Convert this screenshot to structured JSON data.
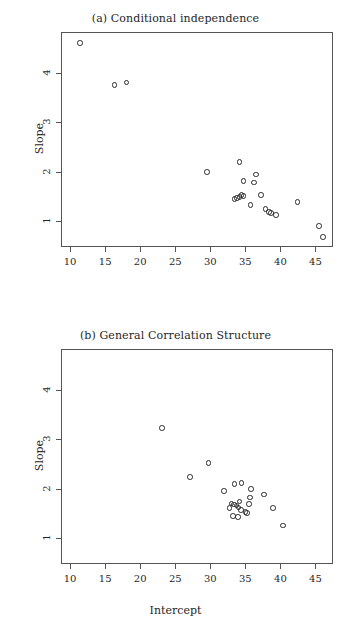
{
  "figure": {
    "width": 351,
    "height": 634,
    "background": "#ffffff",
    "marker_color": "#2a2a2a",
    "axis_color": "#555555"
  },
  "chart_data": [
    {
      "type": "scatter",
      "panel": "a",
      "title": "(a) Conditional independence",
      "xlabel": "",
      "ylabel": "Slope",
      "xlim": [
        8.7,
        47.5
      ],
      "ylim": [
        0.48,
        4.82
      ],
      "xticks": [
        10,
        15,
        20,
        25,
        30,
        35,
        40,
        45
      ],
      "xticklabels": [
        "10",
        "15",
        "20",
        "25",
        "30",
        "35",
        "40",
        "45"
      ],
      "yticks": [
        1,
        2,
        3,
        4
      ],
      "yticklabels": [
        "1",
        "2",
        "3",
        "4"
      ],
      "grid": false,
      "legend": false,
      "marker": "open-circle",
      "n_points": 22,
      "points": [
        {
          "x": 11.3,
          "y": 4.62
        },
        {
          "x": 16.2,
          "y": 3.77
        },
        {
          "x": 17.9,
          "y": 3.82
        },
        {
          "x": 29.4,
          "y": 2.01
        },
        {
          "x": 34.0,
          "y": 2.22
        },
        {
          "x": 36.4,
          "y": 1.96
        },
        {
          "x": 34.6,
          "y": 1.83
        },
        {
          "x": 36.1,
          "y": 1.8
        },
        {
          "x": 33.3,
          "y": 1.47
        },
        {
          "x": 34.0,
          "y": 1.51
        },
        {
          "x": 34.3,
          "y": 1.55
        },
        {
          "x": 34.6,
          "y": 1.53
        },
        {
          "x": 37.1,
          "y": 1.55
        },
        {
          "x": 35.6,
          "y": 1.35
        },
        {
          "x": 37.7,
          "y": 1.27
        },
        {
          "x": 38.2,
          "y": 1.21
        },
        {
          "x": 38.5,
          "y": 1.19
        },
        {
          "x": 39.2,
          "y": 1.15
        },
        {
          "x": 42.3,
          "y": 1.41
        },
        {
          "x": 45.4,
          "y": 0.93
        },
        {
          "x": 45.9,
          "y": 0.7
        },
        {
          "x": 33.7,
          "y": 1.49
        }
      ]
    },
    {
      "type": "scatter",
      "panel": "b",
      "title": "(b) General Correlation Structure",
      "xlabel": "Intercept",
      "ylabel": "Slope",
      "xlim": [
        8.7,
        47.5
      ],
      "ylim": [
        0.48,
        4.82
      ],
      "xticks": [
        10,
        15,
        20,
        25,
        30,
        35,
        40,
        45
      ],
      "xticklabels": [
        "10",
        "15",
        "20",
        "25",
        "30",
        "35",
        "40",
        "45"
      ],
      "yticks": [
        1,
        2,
        3,
        4
      ],
      "yticklabels": [
        "1",
        "2",
        "3",
        "4"
      ],
      "grid": false,
      "legend": false,
      "marker": "open-circle",
      "n_points": 23,
      "points": [
        {
          "x": 23.0,
          "y": 3.25
        },
        {
          "x": 29.6,
          "y": 2.54
        },
        {
          "x": 27.0,
          "y": 2.26
        },
        {
          "x": 33.3,
          "y": 2.11
        },
        {
          "x": 34.3,
          "y": 2.13
        },
        {
          "x": 31.8,
          "y": 1.97
        },
        {
          "x": 35.7,
          "y": 2.01
        },
        {
          "x": 35.5,
          "y": 1.84
        },
        {
          "x": 34.0,
          "y": 1.76
        },
        {
          "x": 35.4,
          "y": 1.71
        },
        {
          "x": 32.9,
          "y": 1.72
        },
        {
          "x": 33.2,
          "y": 1.7
        },
        {
          "x": 33.6,
          "y": 1.68
        },
        {
          "x": 33.9,
          "y": 1.64
        },
        {
          "x": 34.2,
          "y": 1.59
        },
        {
          "x": 34.9,
          "y": 1.55
        },
        {
          "x": 35.1,
          "y": 1.53
        },
        {
          "x": 33.1,
          "y": 1.47
        },
        {
          "x": 33.8,
          "y": 1.45
        },
        {
          "x": 37.5,
          "y": 1.9
        },
        {
          "x": 38.8,
          "y": 1.63
        },
        {
          "x": 40.2,
          "y": 1.28
        },
        {
          "x": 32.6,
          "y": 1.63
        }
      ]
    }
  ]
}
